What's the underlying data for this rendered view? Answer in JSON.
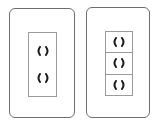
{
  "scene": {
    "description": "Two electrical wall outlet plates",
    "plates": [
      {
        "name": "double-outlet-plate",
        "outlet_count": 2
      },
      {
        "name": "triple-outlet-plate",
        "outlet_count": 3
      }
    ]
  },
  "colors": {
    "plate_border": "#6e6e6e",
    "inset_border": "#9a9a9a",
    "socket": "#1a1a1a",
    "background": "#ffffff"
  }
}
